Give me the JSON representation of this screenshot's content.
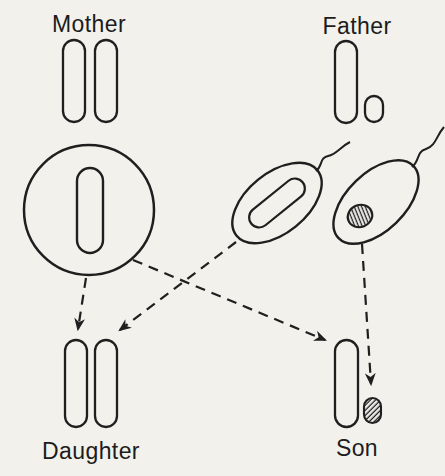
{
  "labels": {
    "mother": "Mother",
    "father": "Father",
    "daughter": "Daughter",
    "son": "Son"
  },
  "colors": {
    "paper": "#f2f1ec",
    "ink": "#1f1f1f"
  },
  "diagram": {
    "type": "sex-chromosome-inheritance",
    "icons": [
      "x-chromosome-icon",
      "y-chromosome-icon",
      "egg-cell-icon",
      "sperm-cell-icon",
      "dashed-arrow-icon"
    ]
  }
}
